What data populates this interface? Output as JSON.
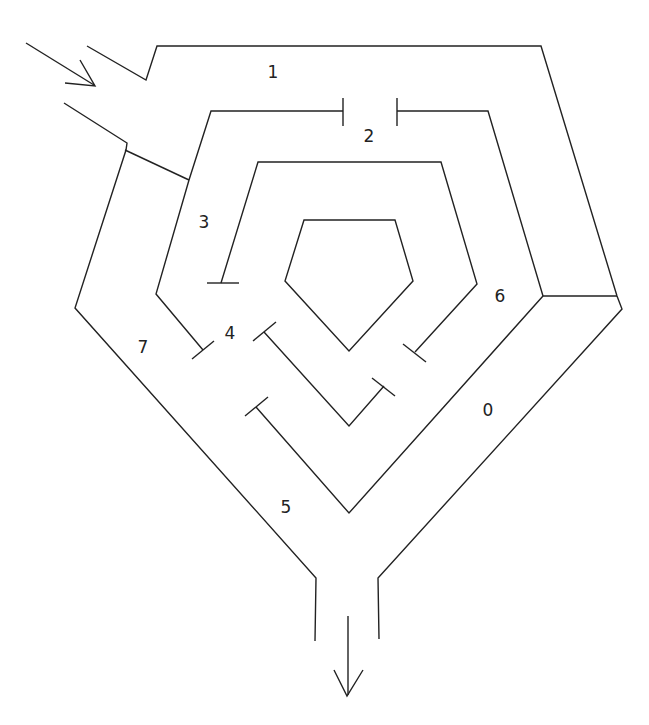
{
  "diagram": {
    "type": "maze",
    "stroke_color": "#222222",
    "background": "#ffffff",
    "regions": [
      {
        "id": "region-0",
        "label": "0",
        "x": 488,
        "y": 411
      },
      {
        "id": "region-1",
        "label": "1",
        "x": 273,
        "y": 73
      },
      {
        "id": "region-2",
        "label": "2",
        "x": 369,
        "y": 137
      },
      {
        "id": "region-3",
        "label": "3",
        "x": 204,
        "y": 223
      },
      {
        "id": "region-4",
        "label": "4",
        "x": 230,
        "y": 334
      },
      {
        "id": "region-5",
        "label": "5",
        "x": 286,
        "y": 508
      },
      {
        "id": "region-6",
        "label": "6",
        "x": 500,
        "y": 297
      },
      {
        "id": "region-7",
        "label": "7",
        "x": 143,
        "y": 348
      }
    ],
    "entry": {
      "label": "entry-arrow",
      "direction": "down-right"
    },
    "exit": {
      "label": "exit-arrow",
      "direction": "down"
    }
  }
}
